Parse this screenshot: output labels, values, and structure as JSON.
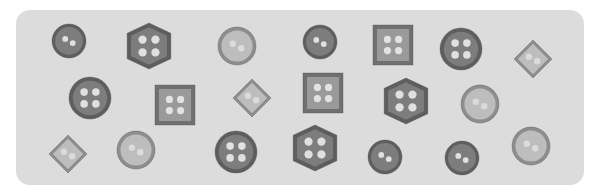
{
  "scene": {
    "description": "Assortment of sewing buttons on a light gray rounded panel",
    "background_color": "#ffffff",
    "panel_color": "#dcdcdc",
    "colors": {
      "dark_fill": "#7d7d7d",
      "dark_rim": "#5e5e5e",
      "mid_fill": "#9a9a9a",
      "mid_rim": "#707070",
      "light_fill": "#bdbdbd",
      "light_rim": "#8d8d8d",
      "hole": "#e6e6e6"
    }
  },
  "buttons": [
    {
      "id": 1,
      "row": 1,
      "shape": "circle",
      "holes": 2,
      "tone": "dark",
      "cx": 69,
      "cy": 41,
      "size": 34
    },
    {
      "id": 2,
      "row": 1,
      "shape": "hexagon",
      "holes": 4,
      "tone": "dark",
      "cx": 149,
      "cy": 46,
      "size": 46
    },
    {
      "id": 3,
      "row": 1,
      "shape": "circle",
      "holes": 2,
      "tone": "light",
      "cx": 237,
      "cy": 46,
      "size": 38
    },
    {
      "id": 4,
      "row": 1,
      "shape": "circle",
      "holes": 2,
      "tone": "dark",
      "cx": 320,
      "cy": 42,
      "size": 34
    },
    {
      "id": 5,
      "row": 1,
      "shape": "square",
      "holes": 4,
      "tone": "mid",
      "cx": 393,
      "cy": 45,
      "size": 40
    },
    {
      "id": 6,
      "row": 1,
      "shape": "circle",
      "holes": 4,
      "tone": "dark",
      "cx": 461,
      "cy": 49,
      "size": 42
    },
    {
      "id": 7,
      "row": 1,
      "shape": "diamond",
      "holes": 2,
      "tone": "light",
      "cx": 533,
      "cy": 59,
      "size": 38
    },
    {
      "id": 8,
      "row": 2,
      "shape": "circle",
      "holes": 4,
      "tone": "dark",
      "cx": 90,
      "cy": 98,
      "size": 42
    },
    {
      "id": 9,
      "row": 2,
      "shape": "square",
      "holes": 4,
      "tone": "mid",
      "cx": 175,
      "cy": 105,
      "size": 40
    },
    {
      "id": 10,
      "row": 2,
      "shape": "diamond",
      "holes": 2,
      "tone": "light",
      "cx": 252,
      "cy": 98,
      "size": 38
    },
    {
      "id": 11,
      "row": 2,
      "shape": "square",
      "holes": 4,
      "tone": "mid",
      "cx": 323,
      "cy": 93,
      "size": 40
    },
    {
      "id": 12,
      "row": 2,
      "shape": "hexagon",
      "holes": 4,
      "tone": "dark",
      "cx": 406,
      "cy": 101,
      "size": 46
    },
    {
      "id": 13,
      "row": 2,
      "shape": "circle",
      "holes": 2,
      "tone": "light",
      "cx": 480,
      "cy": 104,
      "size": 38
    },
    {
      "id": 14,
      "row": 3,
      "shape": "diamond",
      "holes": 2,
      "tone": "light",
      "cx": 68,
      "cy": 154,
      "size": 38
    },
    {
      "id": 15,
      "row": 3,
      "shape": "circle",
      "holes": 2,
      "tone": "light",
      "cx": 136,
      "cy": 150,
      "size": 38
    },
    {
      "id": 16,
      "row": 3,
      "shape": "circle",
      "holes": 4,
      "tone": "dark",
      "cx": 236,
      "cy": 152,
      "size": 42
    },
    {
      "id": 17,
      "row": 3,
      "shape": "hexagon",
      "holes": 4,
      "tone": "dark",
      "cx": 315,
      "cy": 148,
      "size": 46
    },
    {
      "id": 18,
      "row": 3,
      "shape": "circle",
      "holes": 2,
      "tone": "dark",
      "cx": 385,
      "cy": 157,
      "size": 34
    },
    {
      "id": 19,
      "row": 3,
      "shape": "circle",
      "holes": 2,
      "tone": "dark",
      "cx": 462,
      "cy": 158,
      "size": 34
    },
    {
      "id": 20,
      "row": 3,
      "shape": "circle",
      "holes": 2,
      "tone": "light",
      "cx": 531,
      "cy": 146,
      "size": 38
    }
  ],
  "counts": {
    "total": 20,
    "circle": 11,
    "hexagon": 3,
    "square": 3,
    "diamond": 3
  }
}
